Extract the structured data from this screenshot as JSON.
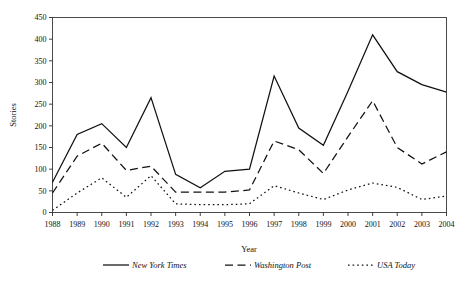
{
  "chart_data": {
    "type": "line",
    "title": "",
    "xlabel": "Year",
    "ylabel": "Stories",
    "x": [
      1988,
      1989,
      1990,
      1991,
      1992,
      1993,
      1994,
      1995,
      1996,
      1997,
      1998,
      1999,
      2000,
      2001,
      2002,
      2003,
      2004
    ],
    "categories": [
      "1988",
      "1989",
      "1990",
      "1991",
      "1992",
      "1993",
      "1994",
      "1995",
      "1996",
      "1997",
      "1998",
      "1999",
      "2000",
      "2001",
      "2002",
      "2003",
      "2004"
    ],
    "xlim": [
      1988,
      2004
    ],
    "ylim": [
      0,
      450
    ],
    "yticks": [
      0,
      50,
      100,
      150,
      200,
      250,
      300,
      350,
      400,
      450
    ],
    "ytick_labels": [
      "0",
      "50",
      "100",
      "150",
      "200",
      "250",
      "300",
      "350",
      "400",
      "450"
    ],
    "grid": false,
    "legend_position": "below",
    "series": [
      {
        "name": "New York Times",
        "style": "solid",
        "values": [
          70,
          180,
          205,
          150,
          265,
          88,
          57,
          95,
          100,
          315,
          195,
          155,
          280,
          410,
          325,
          295,
          278
        ]
      },
      {
        "name": "Washington Post",
        "style": "dashed",
        "values": [
          45,
          130,
          160,
          97,
          107,
          47,
          47,
          47,
          52,
          165,
          145,
          90,
          175,
          258,
          150,
          112,
          140
        ]
      },
      {
        "name": "USA Today",
        "style": "dotted",
        "values": [
          5,
          45,
          80,
          35,
          85,
          20,
          18,
          18,
          20,
          62,
          45,
          30,
          52,
          68,
          58,
          30,
          38
        ]
      }
    ]
  },
  "legend": {
    "entries": [
      {
        "label": "New York Times",
        "style": "solid"
      },
      {
        "label": "Washington Post",
        "style": "dashed"
      },
      {
        "label": "USA Today",
        "style": "dotted"
      }
    ]
  },
  "axes": {
    "y_title": "Stories",
    "x_title": "Year"
  }
}
